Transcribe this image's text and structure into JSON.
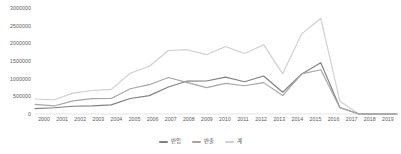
{
  "chart_data": {
    "type": "line",
    "title": "",
    "subtitle": "",
    "xlabel": "",
    "ylabel": "",
    "grid": false,
    "legend_position": "bottom-center",
    "categories": [
      "2000",
      "2001",
      "2002",
      "2003",
      "2004",
      "2005",
      "2006",
      "2007",
      "2008",
      "2009",
      "2010",
      "2011",
      "2012",
      "2013",
      "2014",
      "2015",
      "2016",
      "2017",
      "2018",
      "2019"
    ],
    "x": [
      2000,
      2001,
      2002,
      2003,
      2004,
      2005,
      2006,
      2007,
      2008,
      2009,
      2010,
      2011,
      2012,
      2013,
      2014,
      2015,
      2016,
      2017,
      2018,
      2019
    ],
    "ylim": [
      0,
      3000000
    ],
    "yticks": [
      0,
      500000,
      1000000,
      1500000,
      2000000,
      2500000,
      3000000
    ],
    "ytick_labels": [
      "0",
      "500000",
      "1000000",
      "1500000",
      "2000000",
      "2500000",
      "3000000"
    ],
    "series": [
      {
        "name": "반입",
        "color": "#808080",
        "values": [
          152000,
          176000,
          220000,
          230000,
          258000,
          440000,
          520000,
          765000,
          932000,
          934000,
          1044000,
          913000,
          1074000,
          615000,
          1132000,
          1452000,
          186000,
          0,
          0,
          0
        ]
      },
      {
        "name": "반출",
        "color": "#a6a6a6",
        "values": [
          273000,
          228000,
          370000,
          435000,
          439000,
          715000,
          830000,
          1033000,
          888000,
          745000,
          868000,
          800000,
          888000,
          521000,
          1136000,
          1252000,
          180000,
          0,
          0,
          0
        ]
      },
      {
        "name": "계",
        "color": "#cfcfcf",
        "values": [
          425000,
          404000,
          590000,
          665000,
          697000,
          1155000,
          1350000,
          1798000,
          1820000,
          1679000,
          1912000,
          1713000,
          1962000,
          1136000,
          2268000,
          2704000,
          366000,
          0,
          0,
          0
        ]
      }
    ]
  },
  "legend": {
    "items": [
      {
        "label": "반입"
      },
      {
        "label": "반출"
      },
      {
        "label": "계"
      }
    ]
  }
}
